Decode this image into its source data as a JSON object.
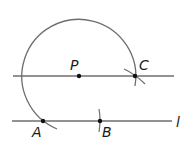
{
  "diagram": {
    "title": "",
    "type": "geometric-construction",
    "colors": {
      "stroke": "#6e6e6e",
      "point": "#111111",
      "text": "#1a1a1a",
      "background": "#ffffff"
    },
    "points": {
      "P": {
        "label": "P"
      },
      "C": {
        "label": "C"
      },
      "A": {
        "label": "A"
      },
      "B": {
        "label": "B"
      }
    },
    "lines": {
      "line_l": {
        "label": "l"
      },
      "line_parallel": {
        "label": ""
      }
    }
  }
}
